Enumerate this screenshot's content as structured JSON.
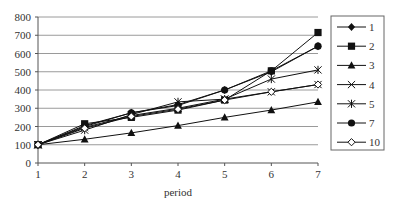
{
  "chart_data": {
    "type": "line",
    "title": "",
    "xlabel": "period",
    "ylabel": "",
    "x": [
      1,
      2,
      3,
      4,
      5,
      6,
      7
    ],
    "ylim": [
      0,
      800
    ],
    "yticks": [
      0,
      100,
      200,
      300,
      400,
      500,
      600,
      700,
      800
    ],
    "grid": true,
    "legend_position": "right",
    "series": [
      {
        "name": "1",
        "marker": "diamond",
        "values": [
          100,
          205,
          275,
          320,
          400,
          500,
          640
        ]
      },
      {
        "name": "2",
        "marker": "square",
        "values": [
          100,
          215,
          250,
          290,
          345,
          505,
          715
        ]
      },
      {
        "name": "3",
        "marker": "triangle",
        "values": [
          100,
          130,
          165,
          205,
          250,
          290,
          335
        ]
      },
      {
        "name": "4",
        "marker": "x",
        "values": [
          100,
          195,
          260,
          300,
          350,
          390,
          430
        ]
      },
      {
        "name": "5",
        "marker": "star",
        "values": [
          100,
          180,
          265,
          335,
          350,
          460,
          510
        ]
      },
      {
        "name": "7",
        "marker": "circle",
        "values": [
          100,
          200,
          275,
          315,
          400,
          505,
          640
        ]
      },
      {
        "name": "10",
        "marker": "open-diamond",
        "values": [
          100,
          190,
          255,
          295,
          345,
          390,
          430
        ]
      }
    ]
  }
}
